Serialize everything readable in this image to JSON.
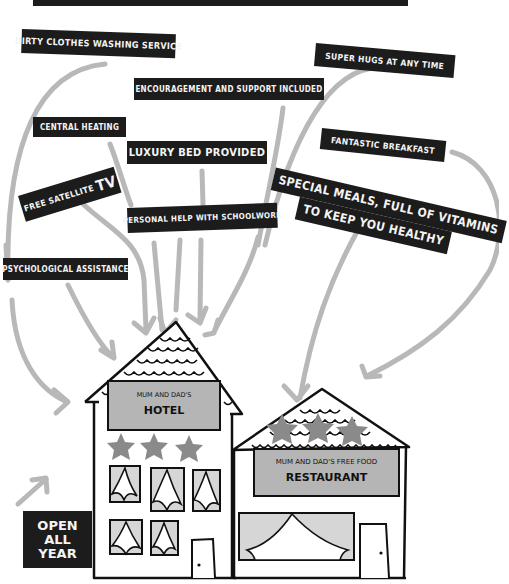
{
  "title_bar": {
    "visible_text": ""
  },
  "labels": [
    {
      "id": "dirty-clothes",
      "text": "Dirty clothes washing service"
    },
    {
      "id": "super-hugs",
      "text": "Super hugs at any time"
    },
    {
      "id": "encouragement",
      "text": "Encouragement and support included"
    },
    {
      "id": "central-heating",
      "text": "Central heating"
    },
    {
      "id": "luxury-bed",
      "text": "Luxury bed provided"
    },
    {
      "id": "fantastic-breakfast",
      "text": "Fantastic breakfast"
    },
    {
      "id": "free-satellite",
      "text": "Free satellite",
      "suffix": "TV"
    },
    {
      "id": "personal-help",
      "text": "Personal help with schoolwork"
    },
    {
      "id": "special-meals",
      "line1": "Special meals, full of vitamins",
      "line2": "to keep you healthy"
    },
    {
      "id": "psychological",
      "text": "Psychological assistance"
    }
  ],
  "hotel": {
    "sign_line1": "MUM AND DAD'S",
    "sign_line2": "HOTEL",
    "stars": 3
  },
  "restaurant": {
    "sign_line1": "MUM AND DAD'S FREE FOOD",
    "sign_line2": "RESTAURANT",
    "stars": 3
  },
  "open_badge": {
    "line1": "OPEN",
    "line2": "ALL",
    "line3": "YEAR"
  },
  "colors": {
    "label_bg": "#1c1c1c",
    "label_text": "#f4f4f4",
    "arrow": "#b8b8b8",
    "sign": "#b5b5b5",
    "star": "#8a8a8a",
    "window": "#d6d6d6"
  }
}
